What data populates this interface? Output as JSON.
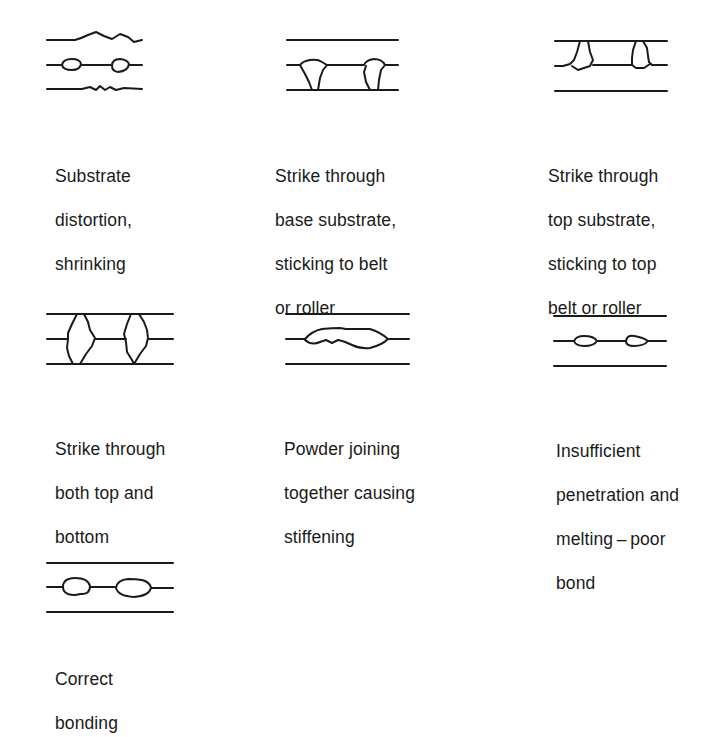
{
  "figure": {
    "panels": [
      {
        "id": "substrate-distortion",
        "caption_lines": [
          "Substrate",
          "distortion,",
          "shrinking"
        ],
        "diagram": "wavy top and bottom substrate lines; two small powder dots on middle line"
      },
      {
        "id": "strike-through-base",
        "caption_lines": [
          "Strike through",
          "base substrate,",
          "sticking to belt",
          "or roller"
        ],
        "diagram": "two adhesive blobs penetrating from middle line down through base substrate"
      },
      {
        "id": "strike-through-top",
        "caption_lines": [
          "Strike through",
          "top substrate,",
          "sticking to top",
          "belt or roller"
        ],
        "diagram": "two adhesive blobs penetrating from middle line up through top substrate"
      },
      {
        "id": "strike-through-both",
        "caption_lines": [
          "Strike through",
          "both top and",
          "bottom"
        ],
        "diagram": "two large adhesive blobs penetrating through both top and bottom substrates"
      },
      {
        "id": "powder-joining",
        "caption_lines": [
          "Powder joining",
          "together causing",
          "stiffening"
        ],
        "diagram": "single elongated merged adhesive mass on middle line"
      },
      {
        "id": "insufficient-penetration",
        "caption_lines": [
          "Insufficient",
          "penetration and",
          "melting – poor",
          "bond"
        ],
        "diagram": "two small flat dots on middle line not touching substrates"
      },
      {
        "id": "correct-bonding",
        "caption_lines": [
          "Correct",
          "bonding"
        ],
        "diagram": "two well-rounded adhesive dots on middle line"
      }
    ],
    "colors": {
      "ink": "#1a1a1a",
      "background": "#ffffff"
    }
  }
}
